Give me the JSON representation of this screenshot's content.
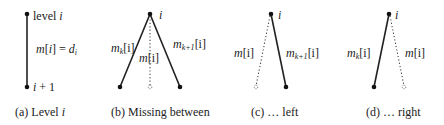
{
  "panels": [
    {
      "id": "a",
      "caption_tag": "(a)",
      "caption_text": "Level ",
      "caption_var": "i",
      "labels": {
        "top_text": "level ",
        "top_var": "i",
        "mid_lhs": "m",
        "mid_bracket_open": "[",
        "mid_idx": "i",
        "mid_bracket_close": "]",
        "mid_eq": " = ",
        "mid_rhs": "d",
        "mid_rhs_sub": "i",
        "bottom_var": "i",
        "bottom_rest": " + 1"
      }
    },
    {
      "id": "b",
      "caption_tag": "(b)",
      "caption_text": "Missing between",
      "labels": {
        "apex": "i",
        "left_m": "m",
        "left_sub": "k",
        "left_idx": "[i]",
        "mid_m": "m",
        "mid_idx": "[i]",
        "right_m": "m",
        "right_sub": "k+1",
        "right_idx": "[i]"
      }
    },
    {
      "id": "c",
      "caption_tag": "(c)",
      "caption_text": "… left",
      "labels": {
        "apex": "i",
        "dotted_m": "m",
        "dotted_idx": "[i]",
        "solid_m": "m",
        "solid_sub": "k+1",
        "solid_idx": "[i]"
      }
    },
    {
      "id": "d",
      "caption_tag": "(d)",
      "caption_text": "… right",
      "labels": {
        "apex": "i",
        "solid_m": "m",
        "solid_sub": "k",
        "solid_idx": "[i]",
        "dotted_m": "m",
        "dotted_idx": "[i]"
      }
    }
  ]
}
